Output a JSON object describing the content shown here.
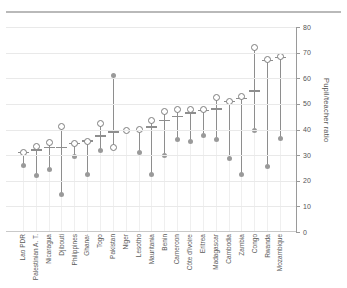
{
  "chart_data": {
    "type": "scatter",
    "title": "",
    "xlabel": "",
    "ylabel": "Pupil/teacher ratio",
    "ylim": [
      0,
      80
    ],
    "yticks": [
      0,
      10,
      20,
      30,
      40,
      50,
      60,
      70,
      80
    ],
    "grid": true,
    "legend": "none",
    "categories": [
      "Lao PDR",
      "Palestinian A. T.",
      "Nicaragua",
      "Djibouti",
      "Philippines",
      "Ghana¹",
      "Togo",
      "Pakistan",
      "Niger",
      "Lesotho",
      "Mauritania",
      "Benin",
      "Cameroon",
      "Côte d'Ivoire",
      "Eritrea",
      "Madagascar",
      "Cambodia",
      "Zambia",
      "Congo",
      "Rwanda",
      "Mozambique"
    ],
    "series": [
      {
        "name": "upper-open-circle",
        "marker": "open-circle",
        "values": [
          31.0,
          33.5,
          35.0,
          41.0,
          34.5,
          35.5,
          42.5,
          33.0,
          39.5,
          40.0,
          43.5,
          47.0,
          48.0,
          48.0,
          48.0,
          52.5,
          51.0,
          53.0,
          72.0,
          67.5,
          68.5
        ]
      },
      {
        "name": "median-dash",
        "marker": "dash",
        "values": [
          31.0,
          32.0,
          33.0,
          33.0,
          34.5,
          35.5,
          37.5,
          39.0,
          39.5,
          39.5,
          41.0,
          43.5,
          45.0,
          46.5,
          47.5,
          48.0,
          51.0,
          52.0,
          55.0,
          67.0,
          68.0
        ]
      },
      {
        "name": "lower-filled-circle",
        "marker": "filled-circle",
        "values": [
          26.0,
          22.0,
          24.5,
          14.5,
          29.5,
          22.5,
          32.0,
          61.0,
          39.5,
          31.0,
          22.5,
          30.0,
          36.0,
          35.5,
          37.5,
          36.0,
          28.5,
          22.5,
          39.5,
          25.5,
          36.5
        ]
      }
    ]
  },
  "colors": {
    "open_circle_stroke": "#7d7d7d",
    "filled_circle": "#9a9a9a",
    "dash": "#8e8e8e",
    "stem": "#8e8e8e",
    "grid": "#e9e9e9",
    "axis": "#9a9a9a",
    "tick_label": "#555555",
    "x_label": "#5a5a5a",
    "top_rule": "#b9b9b9"
  }
}
